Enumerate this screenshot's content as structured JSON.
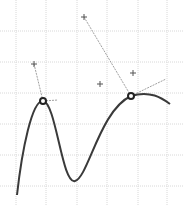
{
  "canvas": {
    "width": 183,
    "height": 206,
    "background": "#ffffff"
  },
  "grid": {
    "color": "#d8d8d8",
    "x_lines": [
      16,
      46,
      77,
      107,
      138,
      167
    ],
    "y_lines": [
      31,
      62,
      93,
      124,
      155,
      186
    ]
  },
  "curve": {
    "color": "#3a3a3a",
    "path": "M17,195 C22,150 32,100 43,101 C56,102 62,185 75,181 C88,178 100,110 131,96 C150,90 162,98 170,104"
  },
  "anchors": [
    {
      "name": "anchor-left",
      "x": 43,
      "y": 101
    },
    {
      "name": "anchor-right",
      "x": 131,
      "y": 96
    }
  ],
  "handles": [
    {
      "from": [
        43,
        101
      ],
      "to": [
        34,
        64
      ]
    },
    {
      "from": [
        43,
        101
      ],
      "to": [
        58,
        100
      ]
    },
    {
      "from": [
        131,
        96
      ],
      "to": [
        84,
        17
      ]
    },
    {
      "from": [
        131,
        96
      ],
      "to": [
        166,
        79
      ]
    }
  ],
  "control_points": [
    {
      "name": "control-point-1",
      "x": 34,
      "y": 64
    },
    {
      "name": "control-point-2",
      "x": 84,
      "y": 17
    },
    {
      "name": "control-point-3",
      "x": 100,
      "y": 84
    },
    {
      "name": "control-point-4",
      "x": 133,
      "y": 73
    }
  ],
  "colors": {
    "handle": "#a0a0a0",
    "marker": "#555555"
  }
}
